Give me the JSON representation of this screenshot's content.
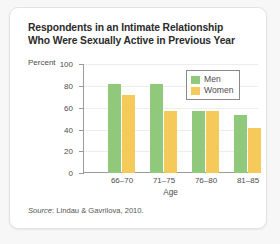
{
  "chart_data": {
    "type": "bar",
    "title": "Respondents in an Intimate Relationship Who Were Sexually Active in Previous Year",
    "title_line1": "Respondents in an Intimate Relationship",
    "title_line2": "Who Were Sexually Active in Previous Year",
    "xlabel": "Age",
    "ylabel": "Percent",
    "ylim": [
      0,
      100
    ],
    "yticks": [
      0,
      20,
      40,
      60,
      80,
      100
    ],
    "ytick_labels": [
      "0",
      "20",
      "40",
      "60",
      "80",
      "100"
    ],
    "categories": [
      "66–70",
      "71–75",
      "76–80",
      "81–85"
    ],
    "series": [
      {
        "name": "Men",
        "color": "#90c97c",
        "values": [
          82,
          82,
          57,
          53
        ]
      },
      {
        "name": "Women",
        "color": "#f6c95b",
        "values": [
          72,
          57,
          57,
          41
        ]
      }
    ],
    "grid": true,
    "legend_position": "top-right",
    "source_prefix": "Source",
    "source_text": ": Lindau & Gavrilova, 2010."
  }
}
